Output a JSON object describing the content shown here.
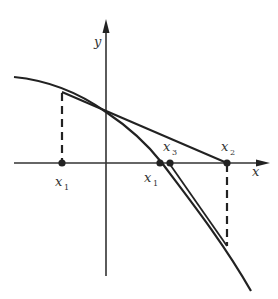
{
  "diagram": {
    "type": "newton-method-iteration",
    "axes": {
      "x_label": "x",
      "y_label": "y"
    },
    "points": [
      {
        "id": "left-x1",
        "label": "x",
        "subscript": "1"
      },
      {
        "id": "root-x1",
        "label": "x",
        "subscript": "1"
      },
      {
        "id": "x3",
        "label": "x",
        "subscript": "3"
      },
      {
        "id": "x2",
        "label": "x",
        "subscript": "2"
      }
    ],
    "colors": {
      "stroke": "#222222",
      "background": "#ffffff"
    }
  }
}
